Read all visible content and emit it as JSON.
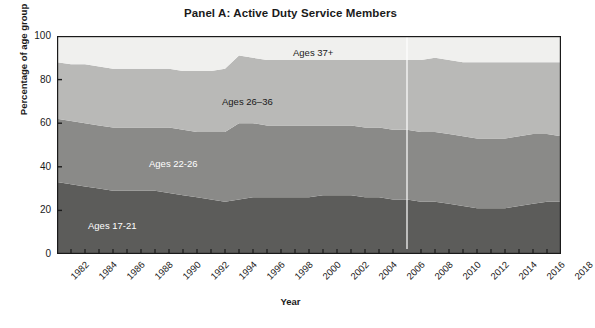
{
  "chart_data": {
    "type": "area",
    "title": "Panel A: Active Duty Service Members",
    "subtitle": "",
    "xlabel": "Year",
    "ylabel": "Percentage of age group",
    "xlim": [
      1982,
      2018
    ],
    "ylim": [
      0,
      100
    ],
    "grid": false,
    "stacked": true,
    "legend_position": "inline-labels",
    "x_tick_labels": [
      "1982",
      "1984",
      "1986",
      "1988",
      "1990",
      "1992",
      "1994",
      "1996",
      "1998",
      "2000",
      "2002",
      "2004",
      "2006",
      "2008",
      "2010",
      "2012",
      "2014",
      "2016",
      "2018"
    ],
    "y_tick_labels": [
      "0",
      "20",
      "40",
      "60",
      "80",
      "100"
    ],
    "y_ticks": [
      0,
      20,
      40,
      60,
      80,
      100
    ],
    "x": [
      1982,
      1983,
      1984,
      1985,
      1986,
      1987,
      1988,
      1989,
      1990,
      1991,
      1992,
      1993,
      1994,
      1995,
      1996,
      1997,
      1998,
      1999,
      2000,
      2001,
      2002,
      2003,
      2004,
      2005,
      2006,
      2007,
      2008,
      2009,
      2010,
      2011,
      2012,
      2013,
      2014,
      2015,
      2016,
      2017,
      2018
    ],
    "series": [
      {
        "name": "Ages 17-21",
        "label": "Ages 17-21",
        "color": "#5c5c5a",
        "values": [
          33,
          32,
          31,
          30,
          29,
          29,
          29,
          29,
          28,
          27,
          26,
          25,
          24,
          25,
          26,
          26,
          26,
          26,
          26,
          27,
          27,
          27,
          26,
          26,
          25,
          25,
          24,
          24,
          23,
          22,
          21,
          21,
          21,
          22,
          23,
          24,
          24
        ]
      },
      {
        "name": "Ages 22-26",
        "label": "Ages 22-26",
        "color": "#8a8a88",
        "values": [
          29,
          29,
          29,
          29,
          29,
          29,
          29,
          29,
          30,
          30,
          30,
          31,
          32,
          35,
          34,
          33,
          33,
          33,
          33,
          32,
          32,
          32,
          32,
          32,
          32,
          32,
          32,
          32,
          32,
          32,
          32,
          32,
          32,
          32,
          32,
          31,
          30
        ]
      },
      {
        "name": "Ages 26-36",
        "label": "Ages 26–36",
        "color": "#b9b9b7",
        "values": [
          26,
          26,
          27,
          27,
          27,
          27,
          27,
          27,
          27,
          27,
          28,
          28,
          29,
          31,
          30,
          30,
          30,
          30,
          30,
          30,
          30,
          30,
          31,
          31,
          32,
          32,
          33,
          34,
          34,
          34,
          35,
          35,
          35,
          34,
          33,
          33,
          34
        ]
      },
      {
        "name": "Ages 37+",
        "label": "Ages 37+",
        "color": "#f0f0ee",
        "values": [
          12,
          13,
          13,
          14,
          15,
          15,
          15,
          15,
          15,
          16,
          16,
          16,
          15,
          9,
          10,
          11,
          11,
          11,
          11,
          11,
          11,
          11,
          11,
          11,
          11,
          11,
          11,
          10,
          11,
          12,
          12,
          12,
          12,
          12,
          12,
          12,
          12
        ]
      }
    ],
    "cumulative_boundaries": {
      "top_of_ages_17_21": [
        33,
        32,
        31,
        30,
        29,
        29,
        29,
        29,
        28,
        27,
        26,
        25,
        24,
        25,
        26,
        26,
        26,
        26,
        26,
        27,
        27,
        27,
        26,
        26,
        25,
        25,
        24,
        24,
        23,
        22,
        21,
        21,
        21,
        22,
        23,
        24,
        24
      ],
      "top_of_ages_22_26": [
        62,
        61,
        60,
        59,
        58,
        58,
        58,
        58,
        58,
        57,
        56,
        56,
        56,
        60,
        60,
        59,
        59,
        59,
        59,
        59,
        59,
        59,
        58,
        58,
        57,
        57,
        56,
        56,
        55,
        54,
        53,
        53,
        53,
        54,
        55,
        55,
        54
      ],
      "top_of_ages_26_36": [
        88,
        87,
        87,
        86,
        85,
        85,
        85,
        85,
        85,
        84,
        84,
        84,
        85,
        91,
        90,
        90,
        89,
        89,
        89,
        89,
        89,
        89,
        89,
        89,
        89,
        89,
        89,
        90,
        89,
        88,
        88,
        88,
        88,
        88,
        88,
        88,
        88
      ]
    },
    "annotations": [
      {
        "name": "reference-line-2007",
        "type": "vertical-line",
        "x": 2007,
        "color": "#ffffff"
      }
    ]
  },
  "axes": {
    "xlabel": "Year",
    "ylabel": "Percentage of age group"
  },
  "title": "Panel A: Active Duty Service Members"
}
